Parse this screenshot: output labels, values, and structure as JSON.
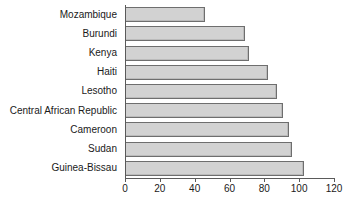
{
  "chart_data": {
    "type": "bar",
    "orientation": "horizontal",
    "title": "",
    "subtitle": "",
    "xlabel": "",
    "ylabel": "",
    "xlim": [
      0,
      120
    ],
    "xticks": [
      0,
      20,
      40,
      60,
      80,
      100,
      120
    ],
    "xtick_labels": [
      "0",
      "20",
      "40",
      "60",
      "80",
      "100",
      "120"
    ],
    "grid": false,
    "legend": null,
    "categories": [
      "Mozambique",
      "Burundi",
      "Kenya",
      "Haiti",
      "Lesotho",
      "Central African Republic",
      "Cameroon",
      "Sudan",
      "Guinea-Bissau"
    ],
    "values": [
      46,
      69,
      71,
      82,
      87,
      91,
      94,
      96,
      103
    ],
    "bar_fill_color": "#d2d2d2",
    "bar_border_color": "#6e6e6e",
    "axis_color": "#5a5a5a",
    "background_color": "#ffffff"
  }
}
